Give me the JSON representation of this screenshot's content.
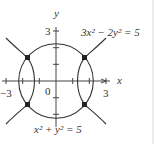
{
  "figure": {
    "axes": {
      "x_label": "x",
      "y_label": "y",
      "origin_label": "0",
      "x_tick_labels": [
        "−3",
        "3"
      ],
      "y_tick_labels": [
        "3"
      ]
    },
    "curves": [
      {
        "name": "circle",
        "equation_label": "x² + y² = 5"
      },
      {
        "name": "hyperbola",
        "equation_label": "3x² − 2y² = 5"
      }
    ],
    "intersection_points": [
      {
        "x": "√3",
        "y": "√2"
      },
      {
        "x": "−√3",
        "y": "√2"
      },
      {
        "x": "√3",
        "y": "−√2"
      },
      {
        "x": "−√3",
        "y": "−√2"
      }
    ],
    "colors": {
      "stroke": "#333333",
      "point": "#222222"
    }
  }
}
